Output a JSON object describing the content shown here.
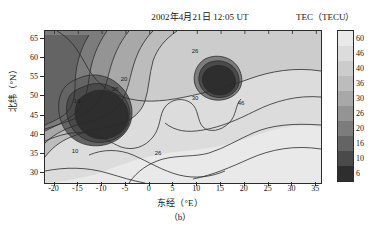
{
  "figure": {
    "title": "2002年4月21日 12:05 UT",
    "subcaption": "（b）",
    "colorbar_title": "TEC（TECU）",
    "xaxis_title": "东经（°E）",
    "yaxis_title": "北纬（°N）"
  },
  "chart_data": {
    "type": "heatmap",
    "title": "2002年4月21日 12:05 UT",
    "subtitle": "（b）",
    "xlabel": "东经（°E）",
    "ylabel": "北纬（°N）",
    "colorbar_label": "TEC（TECU）",
    "xlim": [
      -22,
      36
    ],
    "ylim": [
      27.5,
      67
    ],
    "xticks": [
      -20,
      -15,
      -10,
      -5,
      0,
      5,
      10,
      15,
      20,
      25,
      30,
      35
    ],
    "yticks": [
      30,
      35,
      40,
      45,
      50,
      55,
      60,
      65
    ],
    "grid": false,
    "legend_position": "right",
    "colormap": "grayscale-discrete",
    "contour_levels": [
      6,
      10,
      16,
      20,
      26,
      30,
      36,
      40,
      46,
      60
    ],
    "colorbar_ticks": [
      "60",
      "46",
      "40",
      "36",
      "30",
      "26",
      "20",
      "16",
      "10",
      "6"
    ],
    "colorbar_colors": [
      "#e9e9e9",
      "#dcdcdc",
      "#cccccc",
      "#bcbcbc",
      "#a8a8a8",
      "#949494",
      "#7c7c7c",
      "#646464",
      "#4a4a4a",
      "#2e2e2e"
    ],
    "inline_contour_labels": [
      {
        "text": "26",
        "x": 29.0,
        "y": 60.5
      },
      {
        "text": "30",
        "x": 12.0,
        "y": 50.0
      },
      {
        "text": "46",
        "x": 22.0,
        "y": 45.0
      },
      {
        "text": "36",
        "x": -1.5,
        "y": 45.3
      },
      {
        "text": "20",
        "x": -4.0,
        "y": 47.5
      },
      {
        "text": "16",
        "x": -6.5,
        "y": 41.0
      },
      {
        "text": "10",
        "x": -15.0,
        "y": 34.8
      },
      {
        "text": "26",
        "x": 3.0,
        "y": 34.5
      }
    ],
    "features": [
      {
        "name": "primary TEC depression",
        "center_lon": -9.0,
        "center_lat": 42.5,
        "min_value": 6
      },
      {
        "name": "secondary TEC depression",
        "center_lon": 12.5,
        "center_lat": 53.0,
        "min_value": 6
      },
      {
        "name": "high TEC region",
        "location": "southeast",
        "max_value": 60
      }
    ]
  },
  "axes": {
    "x_ticks": [
      {
        "label": "-20",
        "value": -20
      },
      {
        "label": "-15",
        "value": -15
      },
      {
        "label": "-10",
        "value": -10
      },
      {
        "label": "-5",
        "value": -5
      },
      {
        "label": "0",
        "value": 0
      },
      {
        "label": "5",
        "value": 5
      },
      {
        "label": "10",
        "value": 10
      },
      {
        "label": "15",
        "value": 15
      },
      {
        "label": "20",
        "value": 20
      },
      {
        "label": "25",
        "value": 25
      },
      {
        "label": "30",
        "value": 30
      },
      {
        "label": "35",
        "value": 35
      }
    ],
    "y_ticks": [
      {
        "label": "65",
        "value": 65
      },
      {
        "label": "60",
        "value": 60
      },
      {
        "label": "55",
        "value": 55
      },
      {
        "label": "50",
        "value": 50
      },
      {
        "label": "45",
        "value": 45
      },
      {
        "label": "40",
        "value": 40
      },
      {
        "label": "35",
        "value": 35
      },
      {
        "label": "30",
        "value": 30
      }
    ]
  }
}
